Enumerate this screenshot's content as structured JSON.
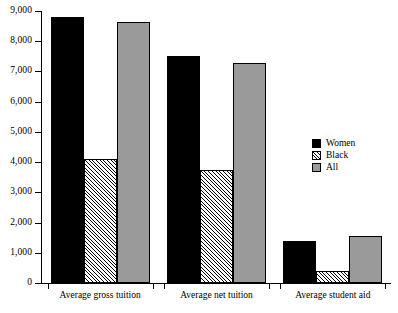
{
  "chart_data": {
    "type": "bar",
    "title": "",
    "xlabel": "",
    "ylabel": "",
    "ylim": [
      0,
      9000
    ],
    "grid": false,
    "legend_position": "right",
    "categories": [
      "Average gross tuition",
      "Average net tuition",
      "Average student aid"
    ],
    "series": [
      {
        "name": "Women",
        "values": [
          8800,
          7500,
          1400
        ],
        "color": "#000000",
        "fill": "solid"
      },
      {
        "name": "Black",
        "values": [
          4100,
          3750,
          400
        ],
        "color": "#ffffff",
        "fill": "hatched"
      },
      {
        "name": "All",
        "values": [
          8650,
          7280,
          1550
        ],
        "color": "#9a9a9a",
        "fill": "solid"
      }
    ],
    "ytick_labels": [
      "9,000",
      "8,000",
      "7,000",
      "6,000",
      "5,000",
      "4,000",
      "3,000",
      "2,000",
      "1,000",
      "0"
    ],
    "ytick_values": [
      9000,
      8000,
      7000,
      6000,
      5000,
      4000,
      3000,
      2000,
      1000,
      0
    ]
  },
  "legend": {
    "items": [
      {
        "label": "Women"
      },
      {
        "label": "Black"
      },
      {
        "label": "All"
      }
    ]
  }
}
